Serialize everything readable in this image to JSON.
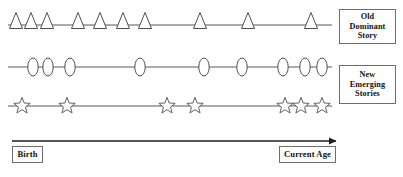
{
  "diagram": {
    "type": "timeline-narrative-therapy",
    "canvas": {
      "width": 403,
      "height": 177,
      "background": "#ffffff"
    },
    "colors": {
      "glyph_stroke": "#4e4e52",
      "axis_line": "#59595b",
      "arrow_line": "#1d1d1d",
      "box_border": "#6d6d70",
      "text": "#101010"
    },
    "rows": [
      {
        "id": "old-dominant-story",
        "glyph": "triangle",
        "line_y": 25,
        "line_x_start": 8,
        "line_x_end": 332,
        "marker_positions": [
          16,
          31,
          47,
          78,
          100,
          123,
          145,
          200,
          248,
          311
        ]
      },
      {
        "id": "new-emerging-stories",
        "glyph": "oval",
        "line_y": 67,
        "line_x_start": 8,
        "line_x_end": 332,
        "marker_positions": [
          33,
          48,
          70,
          140,
          204,
          242,
          283,
          305,
          322
        ]
      },
      {
        "id": "emerging-stories-stars",
        "glyph": "star",
        "line_y": 106,
        "line_x_start": 8,
        "line_x_end": 332,
        "marker_positions": [
          22,
          67,
          167,
          195,
          285,
          301,
          322
        ]
      }
    ],
    "time_arrow": {
      "id": "age-axis-arrow",
      "y": 141,
      "x_start": 12,
      "x_end": 337,
      "direction": "right",
      "head_size": 5
    },
    "labels": {
      "old_dominant_story": {
        "lines": [
          "Old",
          "Dominant",
          "Story"
        ]
      },
      "new_emerging_stories": {
        "lines": [
          "New",
          "Emerging",
          "Stories"
        ]
      },
      "birth": "Birth",
      "current_age": "Current Age"
    }
  }
}
